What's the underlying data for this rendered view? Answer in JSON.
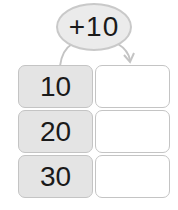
{
  "operator": {
    "label": "+10"
  },
  "table": {
    "rows": [
      {
        "input": "10",
        "output": ""
      },
      {
        "input": "20",
        "output": ""
      },
      {
        "input": "30",
        "output": ""
      }
    ]
  },
  "colors": {
    "input_fill": "#e4e4e4",
    "oval_fill": "#ebebeb",
    "border": "#c4c4c4"
  }
}
